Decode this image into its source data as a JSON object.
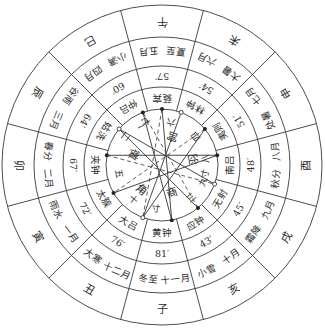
{
  "diagram": {
    "colors": {
      "line": "#3a3a3a",
      "text": "#2a2a2a",
      "background": "#ffffff"
    },
    "geometry": {
      "cx": 162,
      "cy": 165,
      "radii": [
        160,
        128,
        99,
        78,
        56
      ]
    },
    "sectors": [
      {
        "branch": "子",
        "months": [
          "十一月",
          "冬至"
        ],
        "number": "81′",
        "pitch": "黄钟"
      },
      {
        "branch": "丑",
        "months": [
          "十二月",
          "大寒"
        ],
        "number": "76′",
        "pitch": "大吕"
      },
      {
        "branch": "寅",
        "months": [
          "一月",
          "雨水"
        ],
        "number": "72′",
        "pitch": "太簇"
      },
      {
        "branch": "卯",
        "months": [
          "二月",
          "春分"
        ],
        "number": "67′",
        "pitch": "夹钟"
      },
      {
        "branch": "辰",
        "months": [
          "三月",
          "谷雨"
        ],
        "number": "64′",
        "pitch": "姑洗"
      },
      {
        "branch": "巳",
        "months": [
          "四月",
          "小满"
        ],
        "number": "60′",
        "pitch": "仲吕"
      },
      {
        "branch": "午",
        "months": [
          "五月",
          "夏至"
        ],
        "number": "57′",
        "pitch": "蕤宾"
      },
      {
        "branch": "未",
        "months": [
          "六月",
          "大暑"
        ],
        "number": "54′",
        "pitch": "林钟"
      },
      {
        "branch": "申",
        "months": [
          "七月",
          "处暑"
        ],
        "number": "51′",
        "pitch": "夷则"
      },
      {
        "branch": "酉",
        "months": [
          "八月",
          "秋分"
        ],
        "number": "48′",
        "pitch": "南吕"
      },
      {
        "branch": "戌",
        "months": [
          "九月",
          "霜降"
        ],
        "number": "45′",
        "pitch": "无射"
      },
      {
        "branch": "亥",
        "months": [
          "十月",
          "小雪"
        ],
        "number": "43′",
        "pitch": "应钟"
      }
    ],
    "inner": {
      "labels": [
        {
          "text": "宫",
          "angle": 200,
          "r": 30
        },
        {
          "text": "商",
          "angle": 340,
          "r": 30
        },
        {
          "text": "角",
          "angle": 40,
          "r": 32
        },
        {
          "text": "徵",
          "angle": 110,
          "r": 30
        },
        {
          "text": "羽",
          "angle": 260,
          "r": 32
        }
      ],
      "numbers": [
        {
          "text": "一",
          "angle": 152,
          "r": 44
        },
        {
          "text": "二",
          "angle": 128,
          "r": 46
        },
        {
          "text": "三",
          "angle": 318,
          "r": 44
        },
        {
          "text": "四",
          "angle": 230,
          "r": 44
        },
        {
          "text": "五",
          "angle": 78,
          "r": 44
        },
        {
          "text": "六",
          "angle": 192,
          "r": 44
        },
        {
          "text": "七",
          "angle": 160,
          "r": 46
        },
        {
          "text": "八",
          "angle": 262,
          "r": 44
        },
        {
          "text": "九",
          "angle": 292,
          "r": 44
        },
        {
          "text": "十",
          "angle": 40,
          "r": 45
        },
        {
          "text": "寸",
          "angle": 8,
          "r": 44
        },
        {
          "text": "寸",
          "angle": 282,
          "r": 44
        }
      ]
    }
  }
}
